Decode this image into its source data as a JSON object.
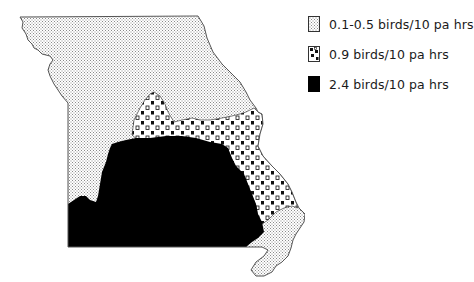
{
  "map": {
    "region": "Missouri",
    "zones": [
      {
        "id": "low",
        "label": "0.1-0.5 birds/10 pa hrs",
        "pattern": "fine-stipple",
        "color": "#bdbdbd"
      },
      {
        "id": "mid",
        "label": "0.9 birds/10 pa hrs",
        "pattern": "checker-dots",
        "color": "#111111"
      },
      {
        "id": "high",
        "label": "2.4 birds/10 pa hrs",
        "pattern": "solid-black",
        "color": "#000000"
      }
    ]
  },
  "legend": {
    "items": [
      {
        "label": "0.1-0.5 birds/10 pa hrs",
        "swatch": "stipple-swatch"
      },
      {
        "label": "0.9 birds/10 pa hrs",
        "swatch": "checker-swatch"
      },
      {
        "label": "2.4 birds/10 pa hrs",
        "swatch": "solid-swatch"
      }
    ]
  }
}
